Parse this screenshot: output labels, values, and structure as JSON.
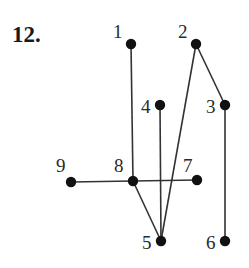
{
  "problem": {
    "number": "12."
  },
  "graph": {
    "nodes": [
      {
        "id": "1",
        "label": "1",
        "x": 131,
        "y": 44,
        "lx": 113,
        "ly": 38
      },
      {
        "id": "2",
        "label": "2",
        "x": 196,
        "y": 44,
        "lx": 178,
        "ly": 38
      },
      {
        "id": "3",
        "label": "3",
        "x": 225,
        "y": 105,
        "lx": 206,
        "ly": 113
      },
      {
        "id": "4",
        "label": "4",
        "x": 160,
        "y": 105,
        "lx": 141,
        "ly": 113
      },
      {
        "id": "5",
        "label": "5",
        "x": 161,
        "y": 241,
        "lx": 142,
        "ly": 249
      },
      {
        "id": "6",
        "label": "6",
        "x": 225,
        "y": 241,
        "lx": 206,
        "ly": 249
      },
      {
        "id": "7",
        "label": "7",
        "x": 197,
        "y": 180,
        "lx": 183,
        "ly": 172
      },
      {
        "id": "8",
        "label": "8",
        "x": 133,
        "y": 181,
        "lx": 114,
        "ly": 172
      },
      {
        "id": "9",
        "label": "9",
        "x": 71,
        "y": 182,
        "lx": 56,
        "ly": 172
      }
    ],
    "edges": [
      [
        "1",
        "8"
      ],
      [
        "9",
        "8"
      ],
      [
        "8",
        "7"
      ],
      [
        "8",
        "5"
      ],
      [
        "4",
        "5"
      ],
      [
        "2",
        "5"
      ],
      [
        "2",
        "3"
      ],
      [
        "3",
        "6"
      ]
    ],
    "colors": {
      "edge": "#333333",
      "node": "#111111",
      "label": "#2a2a2a"
    }
  }
}
